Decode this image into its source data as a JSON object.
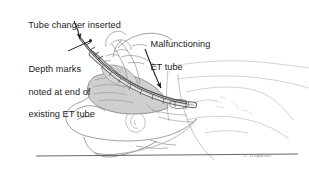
{
  "figure": {
    "kind": "medical-illustration",
    "background_color": "#ffffff",
    "ink_color": "#1b1b1b",
    "line_color": "#6f6f6f",
    "faint_line_color": "#bcbcbc",
    "shade_color": "#c9c9c9"
  },
  "annotations": {
    "tube_changer": {
      "line1": "Tube changer inserted"
    },
    "malfunctioning": {
      "line1": "Malfunctioning",
      "line2": "ET tube"
    },
    "depth_marks": {
      "line1": "Depth marks",
      "line2": "noted at end of",
      "line3": "existing ET tube"
    }
  },
  "signature": {
    "text": "J. Hopkins"
  }
}
